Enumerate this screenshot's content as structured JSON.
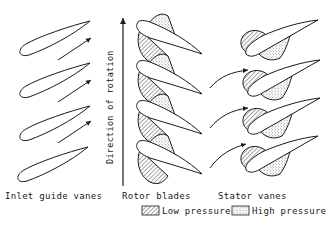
{
  "diagram": {
    "sections": {
      "inlet": "Inlet guide vanes",
      "rotor": "Rotor blades",
      "stator": "Stator vanes"
    },
    "axis_label": "Direction of rotation",
    "legend": {
      "low": "Low pressure",
      "high": "High pressure"
    },
    "colors": {
      "line": "#1a1a1a",
      "background": "#ffffff"
    }
  }
}
